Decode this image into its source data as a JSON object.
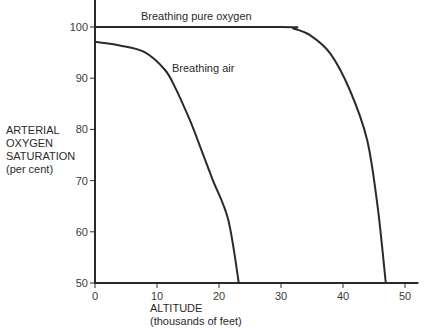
{
  "chart_data": {
    "type": "line",
    "title": "",
    "xlabel": "ALTITUDE",
    "xlabel_sub": "(thousands of feet)",
    "ylabel_lines": [
      "ARTERIAL",
      "OXYGEN",
      "SATURATION",
      "(per cent)"
    ],
    "xlim": [
      0,
      52
    ],
    "ylim": [
      50,
      105
    ],
    "x_ticks": [
      0,
      10,
      20,
      30,
      40,
      50
    ],
    "y_ticks": [
      50,
      60,
      70,
      80,
      90,
      100
    ],
    "grid": false,
    "legend": "inline labels",
    "series": [
      {
        "name": "Breathing pure oxygen",
        "label_pos": {
          "x": 141,
          "y": 20
        },
        "x": [
          0,
          29.8,
          32,
          34.7,
          37.9,
          41.1,
          43.9,
          45.6,
          46.9
        ],
        "y": [
          100,
          100,
          99.7,
          98.4,
          94.9,
          87.7,
          77.9,
          64.8,
          50
        ]
      },
      {
        "name": "Breathing air",
        "label_pos": {
          "x": 172,
          "y": 72
        },
        "x": [
          0,
          4,
          8,
          11.3,
          13,
          15.3,
          17,
          19,
          21.5,
          23.2
        ],
        "y": [
          97.1,
          96.4,
          95.1,
          91.6,
          88,
          81.8,
          76.5,
          70.1,
          62.3,
          50
        ]
      }
    ]
  },
  "colors": {
    "line": "#2a2a2a",
    "background": "#ffffff"
  }
}
